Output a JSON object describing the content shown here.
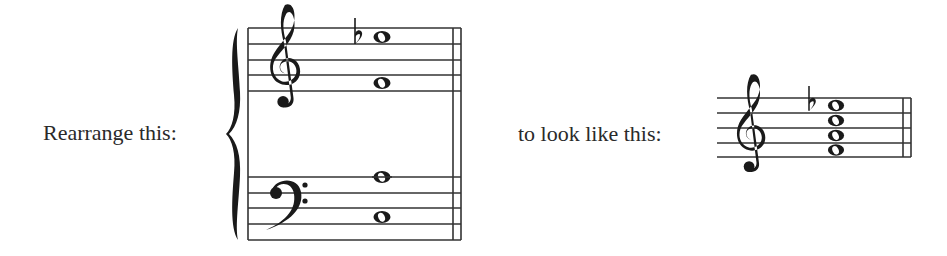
{
  "instruction_left": "Rearrange this:",
  "instruction_right": "to look like this:",
  "source_system": {
    "type": "grand-staff",
    "bracket": "brace",
    "treble_clef": "treble-clef-icon",
    "bass_clef": "bass-clef-icon",
    "treble_notes": [
      {
        "pitch": "E5",
        "accidental": "flat",
        "duration": "whole"
      },
      {
        "pitch": "F4",
        "accidental": null,
        "duration": "whole"
      }
    ],
    "bass_notes": [
      {
        "pitch": "A3",
        "accidental": null,
        "duration": "whole"
      },
      {
        "pitch": "C3",
        "accidental": null,
        "duration": "whole"
      }
    ],
    "final_barline": "double"
  },
  "target_system": {
    "type": "single-staff",
    "clef": "treble-clef-icon",
    "chord_notes": [
      {
        "pitch": "E5",
        "accidental": "flat",
        "duration": "whole"
      },
      {
        "pitch": "C5",
        "accidental": null,
        "duration": "whole"
      },
      {
        "pitch": "A4",
        "accidental": null,
        "duration": "whole"
      },
      {
        "pitch": "F4",
        "accidental": null,
        "duration": "whole"
      }
    ],
    "final_barline": "double"
  }
}
